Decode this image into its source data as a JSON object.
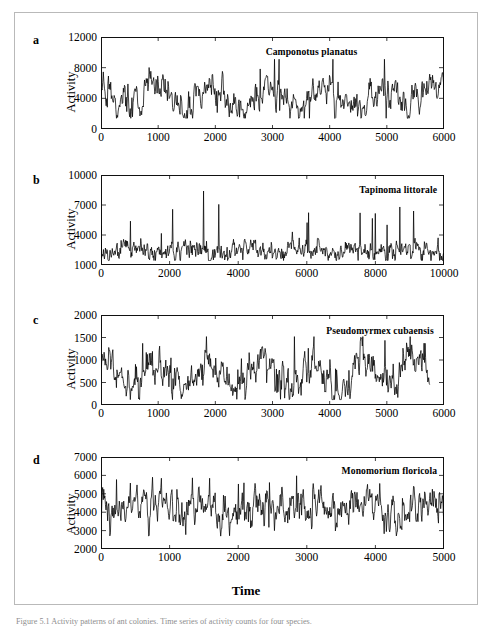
{
  "figure": {
    "x_axis_label": "Time",
    "y_axis_label": "Activity",
    "caption": "Figure 5.1 Activity patterns of ant colonies. Time series of activity counts for four species."
  },
  "panels": [
    {
      "letter": "a",
      "species": "Camponotus planatus",
      "y_label": "Activity",
      "y_ticks": [
        "0",
        "4000",
        "8000",
        "12000"
      ],
      "x_ticks": [
        "0",
        "1000",
        "2000",
        "3000",
        "4000",
        "5000",
        "6000"
      ]
    },
    {
      "letter": "b",
      "species": "Tapinoma littorale",
      "y_label": "Activity",
      "y_ticks": [
        "1000",
        "4000",
        "7000",
        "10000"
      ],
      "x_ticks": [
        "0",
        "2000",
        "4000",
        "6000",
        "8000",
        "10000"
      ]
    },
    {
      "letter": "c",
      "species": "Pseudomyrmex cubaensis",
      "y_label": "Activity",
      "y_ticks": [
        "0",
        "500",
        "1000",
        "1500",
        "2000"
      ],
      "x_ticks": [
        "0",
        "1000",
        "2000",
        "3000",
        "4000",
        "5000",
        "6000"
      ]
    },
    {
      "letter": "d",
      "species": "Monomorium floricola",
      "y_label": "Activity",
      "y_ticks": [
        "2000",
        "3000",
        "4000",
        "5000",
        "6000",
        "7000"
      ],
      "x_ticks": [
        "0",
        "1000",
        "2000",
        "3000",
        "4000",
        "5000"
      ]
    }
  ],
  "chart_data": [
    {
      "type": "line",
      "panel": "a",
      "title": "Camponotus planatus",
      "xlabel": "Time",
      "ylabel": "Activity",
      "xlim": [
        0,
        6000
      ],
      "ylim": [
        0,
        12000
      ],
      "xticks": [
        0,
        1000,
        2000,
        3000,
        4000,
        5000,
        6000
      ],
      "yticks": [
        0,
        4000,
        8000,
        12000
      ],
      "grid": false,
      "legend": "none",
      "line_color": "#000000",
      "data_x_range": [
        0,
        6000
      ],
      "n_points": 600,
      "series": [
        {
          "name": "Camponotus planatus activity",
          "mean": 4100,
          "min": 1400,
          "max": 9100,
          "noise_sd": 900,
          "trend_amplitude": 1500,
          "seed": 17
        }
      ]
    },
    {
      "type": "line",
      "panel": "b",
      "title": "Tapinoma littorale",
      "xlabel": "Time",
      "ylabel": "Activity",
      "xlim": [
        0,
        10000
      ],
      "ylim": [
        1000,
        10000
      ],
      "xticks": [
        0,
        2000,
        4000,
        6000,
        8000,
        10000
      ],
      "yticks": [
        1000,
        4000,
        7000,
        10000
      ],
      "grid": false,
      "legend": "none",
      "line_color": "#000000",
      "data_x_range": [
        0,
        10000
      ],
      "n_points": 700,
      "series": [
        {
          "name": "Tapinoma littorale activity",
          "mean": 2450,
          "min": 1450,
          "max": 8400,
          "noise_sd": 420,
          "trend_amplitude": 400,
          "seed": 41
        }
      ]
    },
    {
      "type": "line",
      "panel": "c",
      "title": "Pseudomyrmex cubaensis",
      "xlabel": "Time",
      "ylabel": "Activity",
      "xlim": [
        0,
        6000
      ],
      "ylim": [
        0,
        2000
      ],
      "xticks": [
        0,
        1000,
        2000,
        3000,
        4000,
        5000,
        6000
      ],
      "yticks": [
        0,
        500,
        1000,
        1500,
        2000
      ],
      "grid": false,
      "legend": "none",
      "line_color": "#000000",
      "data_x_range": [
        0,
        5750
      ],
      "n_points": 640,
      "series": [
        {
          "name": "Pseudomyrmex cubaensis activity",
          "mean": 700,
          "min": 120,
          "max": 1520,
          "noise_sd": 170,
          "trend_amplitude": 230,
          "seed": 73
        }
      ]
    },
    {
      "type": "line",
      "panel": "d",
      "title": "Monomorium floricola",
      "xlabel": "Time",
      "ylabel": "Activity",
      "xlim": [
        0,
        5000
      ],
      "ylim": [
        2000,
        7000
      ],
      "xticks": [
        0,
        1000,
        2000,
        3000,
        4000,
        5000
      ],
      "yticks": [
        2000,
        3000,
        4000,
        5000,
        6000,
        7000
      ],
      "grid": false,
      "legend": "none",
      "line_color": "#000000",
      "data_x_range": [
        0,
        5000
      ],
      "n_points": 620,
      "series": [
        {
          "name": "Monomorium floricola activity",
          "mean": 4250,
          "min": 2700,
          "max": 6150,
          "noise_sd": 430,
          "trend_amplitude": 450,
          "seed": 29
        }
      ]
    }
  ]
}
